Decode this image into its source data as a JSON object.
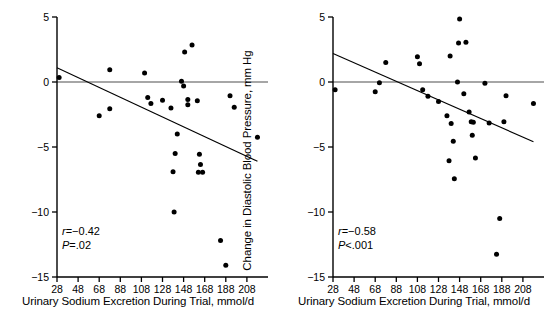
{
  "figure": {
    "background": "#ffffff",
    "ink": "#000000"
  },
  "chart_data": [
    {
      "type": "scatter",
      "panel": "left",
      "title": "",
      "xlabel": "Urinary Sodium Excretion During Trial, mmol/d",
      "ylabel": "Change in Systolic Blood Pressure, mm Hg",
      "xlim": [
        28,
        228
      ],
      "ylim": [
        -15,
        5
      ],
      "xticks": [
        28,
        48,
        68,
        88,
        108,
        128,
        148,
        168,
        188,
        208
      ],
      "yticks": [
        5,
        0,
        -5,
        -10,
        -15
      ],
      "grid": false,
      "legend": null,
      "zero_reference_line": 0,
      "annotations": {
        "r_label": "r",
        "r_value": "=−0.42",
        "p_label": "P",
        "p_value": "=.02"
      },
      "regression_line": {
        "x_start": 28,
        "y_start": 1.1,
        "x_end": 218,
        "y_end": -6.1
      },
      "points": [
        {
          "x": 30,
          "y": 0.35
        },
        {
          "x": 68,
          "y": -2.6
        },
        {
          "x": 78,
          "y": -2.05
        },
        {
          "x": 78,
          "y": 0.95
        },
        {
          "x": 111,
          "y": 0.7
        },
        {
          "x": 114,
          "y": -1.2
        },
        {
          "x": 117,
          "y": -1.65
        },
        {
          "x": 128,
          "y": -1.4
        },
        {
          "x": 136,
          "y": -2.0
        },
        {
          "x": 138,
          "y": -6.9
        },
        {
          "x": 139,
          "y": -10.0
        },
        {
          "x": 140,
          "y": -5.5
        },
        {
          "x": 142,
          "y": -4.0
        },
        {
          "x": 146,
          "y": 0.05
        },
        {
          "x": 148,
          "y": -0.3
        },
        {
          "x": 149,
          "y": 2.3
        },
        {
          "x": 152,
          "y": -1.35
        },
        {
          "x": 152,
          "y": -1.75
        },
        {
          "x": 156,
          "y": 2.85
        },
        {
          "x": 161,
          "y": -1.45
        },
        {
          "x": 163,
          "y": -5.55
        },
        {
          "x": 164,
          "y": -6.35
        },
        {
          "x": 162,
          "y": -6.95
        },
        {
          "x": 166,
          "y": -6.95
        },
        {
          "x": 183,
          "y": -12.2
        },
        {
          "x": 188,
          "y": -14.1
        },
        {
          "x": 192,
          "y": -1.05
        },
        {
          "x": 196,
          "y": -1.95
        },
        {
          "x": 218,
          "y": -4.25
        }
      ]
    },
    {
      "type": "scatter",
      "panel": "right",
      "title": "",
      "xlabel": "Urinary Sodium Excretion During Trial, mmol/d",
      "ylabel": "Change in Diastolic Blood Pressure, mm Hg",
      "xlim": [
        28,
        228
      ],
      "ylim": [
        -15,
        5
      ],
      "xticks": [
        28,
        48,
        68,
        88,
        108,
        128,
        148,
        168,
        188,
        208
      ],
      "yticks": [
        5,
        0,
        -5,
        -10,
        -15
      ],
      "grid": false,
      "legend": null,
      "zero_reference_line": 0,
      "annotations": {
        "r_label": "r",
        "r_value": "=−0.58",
        "p_label": "P",
        "p_value": "<.001"
      },
      "regression_line": {
        "x_start": 28,
        "y_start": 2.2,
        "x_end": 218,
        "y_end": -4.6
      },
      "points": [
        {
          "x": 30,
          "y": -0.6
        },
        {
          "x": 68,
          "y": -0.75
        },
        {
          "x": 72,
          "y": -0.05
        },
        {
          "x": 78,
          "y": 1.5
        },
        {
          "x": 108,
          "y": 1.95
        },
        {
          "x": 110,
          "y": 1.4
        },
        {
          "x": 113,
          "y": -0.6
        },
        {
          "x": 118,
          "y": -1.1
        },
        {
          "x": 128,
          "y": -1.5
        },
        {
          "x": 136,
          "y": -2.6
        },
        {
          "x": 138,
          "y": -6.05
        },
        {
          "x": 139,
          "y": 2.0
        },
        {
          "x": 140,
          "y": -3.2
        },
        {
          "x": 142,
          "y": -4.55
        },
        {
          "x": 143,
          "y": -7.45
        },
        {
          "x": 146,
          "y": 0.0
        },
        {
          "x": 147,
          "y": 3.0
        },
        {
          "x": 148,
          "y": 4.85
        },
        {
          "x": 152,
          "y": -0.9
        },
        {
          "x": 154,
          "y": 3.05
        },
        {
          "x": 157,
          "y": -2.3
        },
        {
          "x": 159,
          "y": -3.05
        },
        {
          "x": 161,
          "y": -3.1
        },
        {
          "x": 160,
          "y": -4.1
        },
        {
          "x": 163,
          "y": -5.85
        },
        {
          "x": 172,
          "y": -0.1
        },
        {
          "x": 176,
          "y": -3.15
        },
        {
          "x": 183,
          "y": -13.25
        },
        {
          "x": 186,
          "y": -10.5
        },
        {
          "x": 190,
          "y": -3.05
        },
        {
          "x": 192,
          "y": -1.05
        },
        {
          "x": 218,
          "y": -1.65
        }
      ]
    }
  ]
}
